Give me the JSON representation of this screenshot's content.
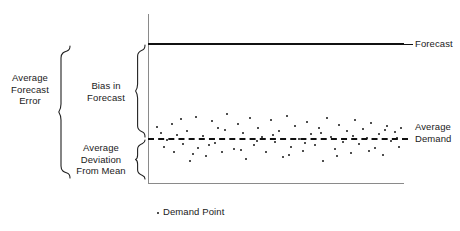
{
  "figure": {
    "background_color": "#ffffff",
    "ink_color": "#111111",
    "axis_color": "#8a8a8a"
  },
  "labels": {
    "average_forecast_error": "Average\nForecast\nError",
    "bias_in_forecast": "Bias in\nForecast",
    "average_deviation_from_mean": "Average\nDeviation\nFrom Mean",
    "forecast": "Forecast",
    "average_demand": "Average\nDemand",
    "demand_point_legend": "Demand Point"
  },
  "chart_data": {
    "type": "scatter",
    "title": "",
    "xlabel": "",
    "ylabel": "",
    "grid": false,
    "legend_position": "bottom-center",
    "legend": [
      "Demand Point"
    ],
    "axis": {
      "y_axis_x": 148,
      "y_axis_top": 14,
      "y_axis_bottom": 183,
      "x_axis_y": 183,
      "x_axis_left": 148,
      "x_axis_right": 404
    },
    "reference_lines": [
      {
        "name": "Forecast",
        "style": "solid",
        "y": 44,
        "x_start": 148,
        "x_end": 404,
        "label": "Forecast"
      },
      {
        "name": "Average Demand",
        "style": "dashed",
        "y": 138,
        "x_start": 148,
        "x_end": 408,
        "label": "Average Demand"
      }
    ],
    "annotations": [
      {
        "name": "Average Forecast Error",
        "type": "brace",
        "spans_from_line": "Forecast",
        "spans_to": "lower bound of deviation band",
        "y_top": 46,
        "y_bottom": 178
      },
      {
        "name": "Bias in Forecast",
        "type": "brace",
        "spans_from_line": "Forecast",
        "spans_to": "Average Demand",
        "y_top": 44,
        "y_bottom": 138
      },
      {
        "name": "Average Deviation From Mean",
        "type": "brace",
        "spans_from_line": "Average Demand",
        "spans_to": "lower edge of scatter",
        "y_top": 138,
        "y_bottom": 178
      }
    ],
    "points": [
      [
        161,
        133
      ],
      [
        167,
        140
      ],
      [
        172,
        124
      ],
      [
        174,
        152
      ],
      [
        181,
        119
      ],
      [
        183,
        144
      ],
      [
        187,
        131
      ],
      [
        190,
        161
      ],
      [
        196,
        117
      ],
      [
        198,
        148
      ],
      [
        203,
        136
      ],
      [
        206,
        156
      ],
      [
        212,
        121
      ],
      [
        215,
        143
      ],
      [
        218,
        128
      ],
      [
        222,
        152
      ],
      [
        227,
        114
      ],
      [
        231,
        139
      ],
      [
        234,
        149
      ],
      [
        238,
        124
      ],
      [
        243,
        133
      ],
      [
        246,
        159
      ],
      [
        250,
        118
      ],
      [
        254,
        145
      ],
      [
        258,
        128
      ],
      [
        262,
        137
      ],
      [
        266,
        152
      ],
      [
        271,
        120
      ],
      [
        275,
        142
      ],
      [
        279,
        131
      ],
      [
        283,
        157
      ],
      [
        287,
        116
      ],
      [
        291,
        147
      ],
      [
        295,
        126
      ],
      [
        299,
        139
      ],
      [
        303,
        151
      ],
      [
        307,
        122
      ],
      [
        311,
        134
      ],
      [
        315,
        145
      ],
      [
        319,
        128
      ],
      [
        323,
        161
      ],
      [
        327,
        118
      ],
      [
        331,
        137
      ],
      [
        335,
        149
      ],
      [
        339,
        125
      ],
      [
        343,
        142
      ],
      [
        347,
        131
      ],
      [
        351,
        153
      ],
      [
        355,
        120
      ],
      [
        359,
        144
      ],
      [
        363,
        129
      ],
      [
        367,
        138
      ],
      [
        371,
        123
      ],
      [
        375,
        148
      ],
      [
        379,
        134
      ],
      [
        383,
        155
      ],
      [
        387,
        126
      ],
      [
        391,
        141
      ],
      [
        395,
        132
      ],
      [
        399,
        147
      ],
      [
        157,
        127
      ],
      [
        164,
        147
      ],
      [
        177,
        135
      ],
      [
        193,
        154
      ],
      [
        209,
        145
      ],
      [
        225,
        130
      ],
      [
        241,
        150
      ],
      [
        257,
        141
      ],
      [
        273,
        135
      ],
      [
        289,
        155
      ],
      [
        305,
        143
      ],
      [
        321,
        133
      ],
      [
        337,
        156
      ],
      [
        353,
        136
      ],
      [
        369,
        151
      ],
      [
        385,
        130
      ],
      [
        397,
        138
      ],
      [
        401,
        128
      ]
    ]
  }
}
